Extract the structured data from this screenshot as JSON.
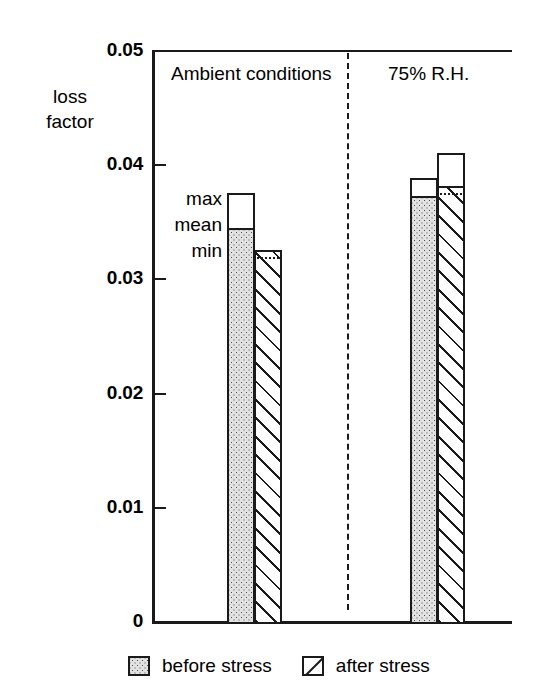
{
  "chart_data": {
    "type": "bar",
    "title": "",
    "subtitle": "",
    "xlabel": "",
    "ylabel": "loss factor",
    "ylim": [
      0,
      0.05
    ],
    "ytick_labels": [
      "0.05",
      "0.04",
      "0.03",
      "0.02",
      "0.01",
      "0"
    ],
    "ytick_values": [
      0.05,
      0.04,
      0.03,
      0.02,
      0.01,
      0
    ],
    "grid": false,
    "legend_position": "bottom",
    "panels": [
      {
        "id": "ambient",
        "label": "Ambient conditions"
      },
      {
        "id": "rh75",
        "label": "75% R.H."
      }
    ],
    "series": [
      {
        "name": "before stress",
        "fill": "dotted"
      },
      {
        "name": "after stress",
        "fill": "hatched"
      }
    ],
    "annotations": {
      "max": "max",
      "mean": "mean",
      "min": "min"
    },
    "bars": [
      {
        "panel": "Ambient conditions",
        "series": "before stress",
        "max": 0.0376,
        "mean": 0.0345,
        "min": 0.0345
      },
      {
        "panel": "Ambient conditions",
        "series": "after stress",
        "max": 0.0326,
        "mean": 0.0326,
        "min": 0.032
      },
      {
        "panel": "75% R.H.",
        "series": "before stress",
        "max": 0.0389,
        "mean": 0.0373,
        "min": 0.0373
      },
      {
        "panel": "75% R.H.",
        "series": "after stress",
        "max": 0.0411,
        "mean": 0.0382,
        "min": 0.0376
      }
    ]
  },
  "axis": {
    "title_line1": "loss",
    "title_line2": "factor",
    "ticks": [
      {
        "label": "0.05",
        "value": 0.05
      },
      {
        "label": "0.04",
        "value": 0.04
      },
      {
        "label": "0.03",
        "value": 0.03
      },
      {
        "label": "0.02",
        "value": 0.02
      },
      {
        "label": "0.01",
        "value": 0.01
      },
      {
        "label": "0",
        "value": 0
      }
    ]
  },
  "panels": {
    "left_label": "Ambient conditions",
    "right_label": "75% R.H."
  },
  "stats": {
    "max": "max",
    "mean": "mean",
    "min": "min"
  },
  "legend": {
    "items": [
      {
        "label": "before stress",
        "swatch": "dotted-swatch"
      },
      {
        "label": "after stress",
        "swatch": "hatched-swatch"
      }
    ]
  }
}
